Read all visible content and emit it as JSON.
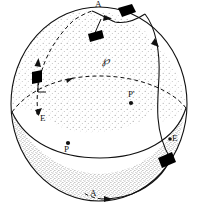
{
  "figure": {
    "background_color": "#ffffff",
    "ink_color": "#111111",
    "stipple_light_color": "#bfbfbf",
    "stipple_dark_color": "#8c8c8c",
    "marker_color": "#000000",
    "width": 199,
    "height": 210
  },
  "labels": {
    "region": "℘",
    "apex_top": "A",
    "apex_bottom": "A",
    "equator_left": "E",
    "equator_right": "E",
    "point_front": "P",
    "point_image": "P'"
  },
  "elements": {
    "sphere_outline": "sphere-outline",
    "equator_front": "equator-front-arc",
    "equator_back": "equator-back-arc-dashed",
    "region_boundary_left": "dashed-meridian-arc",
    "region_boundary_right": "solid-meridian-arc",
    "region_boundary_top": "top-boundary-arc",
    "lower_shaded_cap": "lower-shaded-region"
  },
  "markers": {
    "frame_upper_left": "tangent-frame-marker",
    "frame_top_inner": "tangent-frame-marker",
    "frame_top_right": "tangent-frame-marker",
    "frame_lower_right": "tangent-frame-marker"
  },
  "arrows": {
    "dashed_meridian_up": "direction-arrowhead",
    "top_arc": "direction-arrowhead",
    "right_meridian_down": "direction-arrowhead",
    "bottom_arc": "direction-arrowhead",
    "equator_back": "direction-arrowhead"
  }
}
